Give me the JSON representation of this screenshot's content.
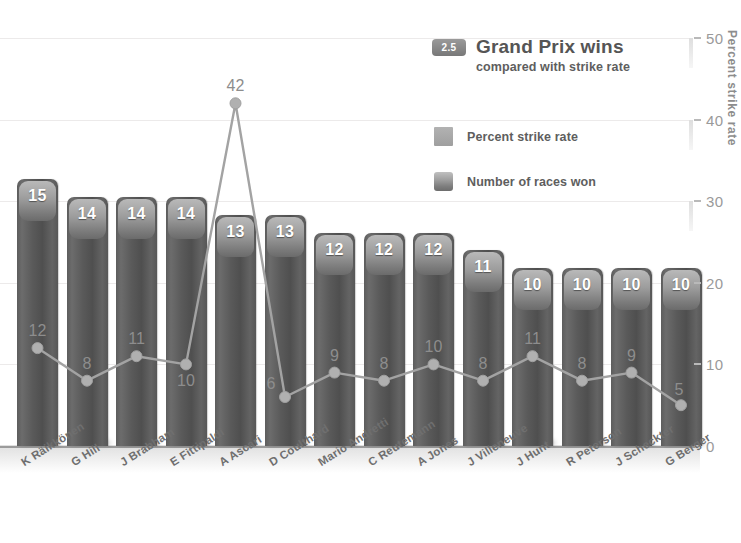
{
  "legend": {
    "badge": "2.5",
    "title": "Grand Prix wins",
    "subtitle": "compared with strike rate",
    "items": [
      {
        "label": "Percent strike rate",
        "swatch": "flat-square-swatch"
      },
      {
        "label": "Number of races  won",
        "swatch": "bar-swatch"
      }
    ]
  },
  "axes": {
    "y_label": "Percent strike rate",
    "y_ticks": [
      "0",
      "10",
      "20",
      "30",
      "40",
      "50"
    ]
  },
  "chart_data": {
    "type": "bar",
    "title": "Grand Prix wins",
    "subtitle": "compared with strike rate",
    "xlabel": "",
    "ylabel": "Percent strike rate",
    "ylim": [
      0,
      50
    ],
    "grid": true,
    "legend_position": "upper-right",
    "categories": [
      "K Räikkönen",
      "G Hill",
      "J Brabham",
      "E Fittipaldi",
      "A Ascari",
      "D Coulthard",
      "Mario Andretti",
      "C Reutemann",
      "A Jones",
      "J Villeneuve",
      "J Hunt",
      "R Peterson",
      "J Scheckter",
      "G Berger"
    ],
    "series": [
      {
        "name": "Number of races  won",
        "type": "bar",
        "values": [
          15,
          14,
          14,
          14,
          13,
          13,
          12,
          12,
          12,
          11,
          10,
          10,
          10,
          10
        ]
      },
      {
        "name": "Percent strike rate",
        "type": "line",
        "values": [
          12,
          8,
          11,
          10,
          42,
          6,
          9,
          8,
          10,
          8,
          11,
          8,
          9,
          5
        ]
      }
    ]
  }
}
